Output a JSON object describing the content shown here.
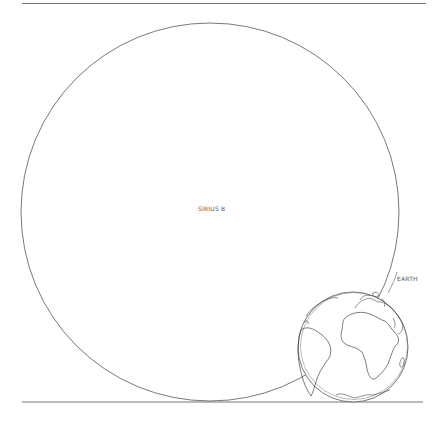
{
  "diagram": {
    "objects": [
      {
        "name": "Sirius B",
        "label": "SIRIUS B",
        "cx": 210,
        "cy": 212,
        "r": 189
      },
      {
        "name": "Earth",
        "label": "EARTH",
        "cx": 353,
        "cy": 347,
        "r": 55
      }
    ],
    "stroke_color": "#555555",
    "background": "#ffffff"
  }
}
